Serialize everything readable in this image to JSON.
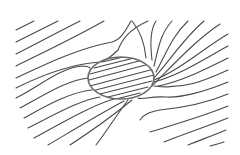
{
  "diagram": {
    "width": 240,
    "height": 155,
    "colors": {
      "background": "#ffffff",
      "line": "#4a4a4a",
      "ellipse": "#6a6a6a"
    },
    "inclusion": {
      "cx": 121,
      "cy": 78,
      "rx": 33,
      "ry": 21
    },
    "field_lines": [
      "M16,30 C22,27 28,24 34,21",
      "M16,42 C30,35 44,28 58,21",
      "M16,54 C36,44 58,32 80,21",
      "M16,66 C40,54 70,40 104,21",
      "M16,78 C50,62 80,48 112,42 C120,40 125,32 131,21",
      "M16,88 C40,76 70,64 100,62 C106,61 112,56 118,50 C122,40 128,30 148,21",
      "M16,98 C40,86 60,68 82,66 C86,66 88,66 90,68",
      "M20,108 C46,94 68,80 88,78",
      "M24,118 C46,106 70,92 92,90",
      "M28,128 C52,116 80,100 100,97",
      "M34,138 C60,124 90,106 114,99",
      "M48,145 C70,132 96,116 124,101",
      "M70,145 C90,132 110,118 132,100",
      "M96,145 C106,132 116,116 128,100",
      "M132,21 C138,28 144,38 146,58",
      "M156,21 C150,30 150,44 152,60",
      "M172,21 C160,34 158,50 154,66",
      "M188,21 C172,36 166,54 156,72",
      "M204,21 C184,38 172,58 154,78",
      "M220,24 C196,40 176,62 152,86",
      "M228,34 C204,48 180,70 154,80",
      "M228,46 C206,58 182,74 154,82",
      "M228,58 C204,70 180,82 158,86",
      "M228,70 C206,80 184,90 154,86",
      "M228,82 C204,92 180,98 166,97 C150,96 142,100 138,98",
      "M228,94 C204,104 180,108 160,110 C150,112 144,114 140,120",
      "M228,106 C204,116 176,124 150,132",
      "M228,118 C208,126 184,134 164,142",
      "M226,130 C212,136 200,140 188,145",
      "M224,142 C218,144 214,145 210,146"
    ],
    "inner_lines": [
      "M90,74 L150,58",
      "M89,80 L153,63",
      "M90,86 L154,69",
      "M92,91 L154,75",
      "M96,95 L152,81",
      "M104,98 L148,87",
      "M116,99 L140,93",
      "M94,68 L146,55",
      "M102,62 L136,54"
    ]
  }
}
